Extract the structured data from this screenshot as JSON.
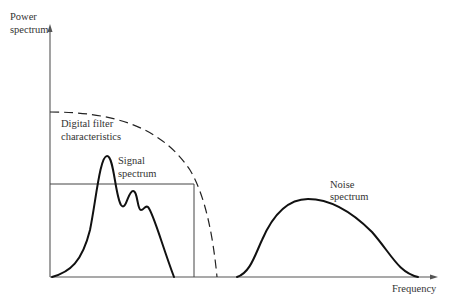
{
  "diagram": {
    "y_axis": {
      "label_line1": "Power",
      "label_line2": "spectrum"
    },
    "x_axis": {
      "label": "Frequency"
    },
    "annotations": {
      "filter_line1": "Digital filter",
      "filter_line2": "characteristics",
      "signal_line1": "Signal",
      "signal_line2": "spectrum",
      "noise_line1": "Noise",
      "noise_line2": "spectrum"
    },
    "colors": {
      "ink": "#111111",
      "axis": "#555555",
      "background": "#ffffff"
    }
  }
}
